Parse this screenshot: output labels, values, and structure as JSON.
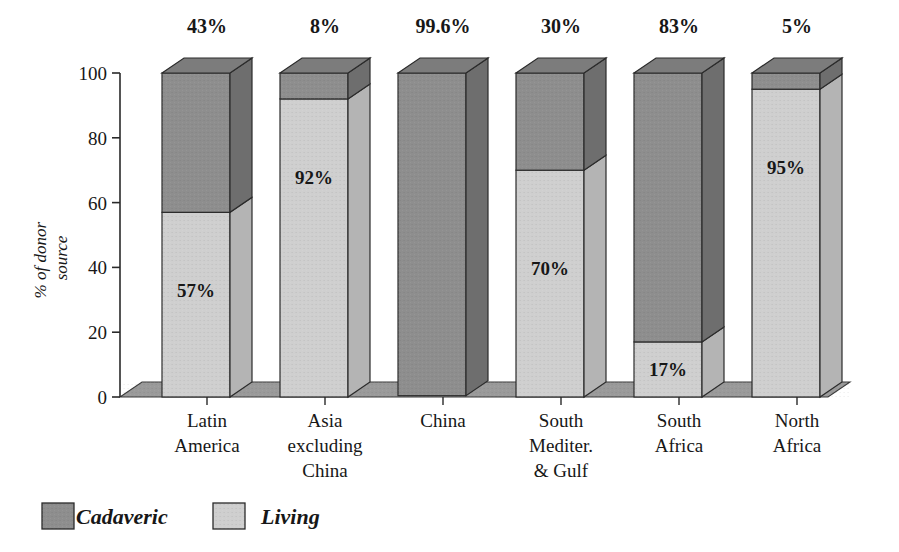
{
  "chart_data": {
    "type": "bar",
    "subtype": "stacked-3d-column",
    "title": "",
    "xlabel": "",
    "ylabel": "% of donor source",
    "ylim": [
      0,
      100
    ],
    "yticks": [
      0,
      20,
      40,
      60,
      80,
      100
    ],
    "ytick_labels": [
      "0",
      "20",
      "40",
      "60",
      "80",
      "100"
    ],
    "grid": false,
    "legend_position": "bottom-left",
    "categories": [
      "Latin America",
      "Asia excluding China",
      "China",
      "South Mediter. & Gulf",
      "South Africa",
      "North Africa"
    ],
    "category_lines": [
      [
        "Latin",
        "America"
      ],
      [
        "Asia",
        "excluding",
        "China"
      ],
      [
        "China"
      ],
      [
        "South",
        "Mediter.",
        "& Gulf"
      ],
      [
        "South",
        "Africa"
      ],
      [
        "North",
        "Africa"
      ]
    ],
    "series": [
      {
        "name": "Living",
        "color": "#cfcfcf",
        "side_color": "#b4b4b4",
        "top_color": "#c4c4c4",
        "values": [
          57,
          92,
          0.4,
          70,
          17,
          95
        ],
        "labels": [
          "57%",
          "92%",
          "",
          "70%",
          "17%",
          "95%"
        ]
      },
      {
        "name": "Cadaveric",
        "color": "#8e8e8e",
        "side_color": "#6e6e6e",
        "top_color": "#7c7c7c",
        "values": [
          43,
          8,
          99.6,
          30,
          83,
          5
        ],
        "labels": [
          "43%",
          "8%",
          "99.6%",
          "30%",
          "83%",
          "5%"
        ]
      }
    ],
    "top_labels": [
      "43%",
      "8%",
      "99.6%",
      "30%",
      "83%",
      "5%"
    ],
    "inner_labels": [
      "57%",
      "92%",
      "",
      "70%",
      "17%",
      "95%"
    ]
  },
  "legend": {
    "items": [
      {
        "label": "Cadaveric",
        "color": "#8e8e8e"
      },
      {
        "label": "Living",
        "color": "#cfcfcf"
      }
    ]
  },
  "axis": {
    "y_title": "% of donor source",
    "y_title_line1": "% of donor",
    "y_title_line2": "source",
    "y_tick_labels": [
      "100",
      "80",
      "60",
      "40",
      "20",
      "0"
    ]
  }
}
